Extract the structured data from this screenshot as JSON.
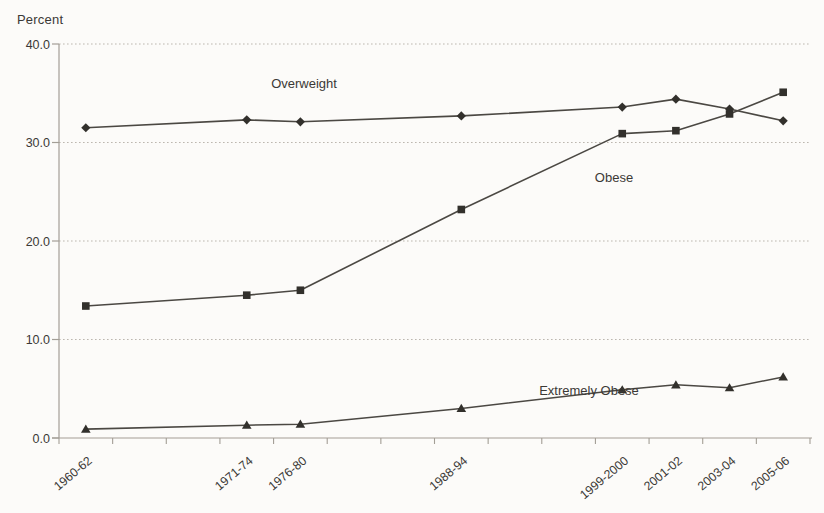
{
  "chart_data": {
    "type": "line",
    "title": "",
    "ylabel": "Percent",
    "xlabel": "",
    "ylim": [
      0,
      40
    ],
    "yticks": [
      0,
      10,
      20,
      30,
      40
    ],
    "ytick_labels": [
      "0.0",
      "10.0",
      "20.0",
      "30.0",
      "40.0"
    ],
    "categories": [
      "1960-62",
      "1971-74",
      "1976-80",
      "1988-94",
      "1999-2000",
      "2001-02",
      "2003-04",
      "2005-06"
    ],
    "category_slots": [
      0.5,
      3.5,
      4.5,
      7.5,
      10.5,
      11.5,
      12.5,
      13.5
    ],
    "total_slots": 14,
    "grid": "horizontal dotted gridlines",
    "legend_position": "inline annotations next to each line (no legend box)",
    "series": [
      {
        "name": "Overweight",
        "marker": "diamond",
        "values": [
          31.5,
          32.3,
          32.1,
          32.7,
          33.6,
          34.4,
          33.4,
          32.2
        ]
      },
      {
        "name": "Obese",
        "marker": "square",
        "values": [
          13.4,
          14.5,
          15.0,
          23.2,
          30.9,
          31.2,
          32.9,
          35.1
        ]
      },
      {
        "name": "Extremely Obese",
        "marker": "triangle",
        "values": [
          0.9,
          1.3,
          1.4,
          3.0,
          4.9,
          5.4,
          5.1,
          6.2
        ]
      }
    ],
    "annotations": [
      {
        "text": "Overweight",
        "x": 304,
        "y": 88
      },
      {
        "text": "Obese",
        "x": 614,
        "y": 182
      },
      {
        "text": "Extremely Obese",
        "x": 589,
        "y": 395
      }
    ],
    "colors": {
      "line": "#4b4843",
      "marker": "#32302c",
      "axis": "#a39e96",
      "grid": "#bcb7af",
      "text": "#3b3936",
      "background": "#fcfbf9"
    }
  }
}
